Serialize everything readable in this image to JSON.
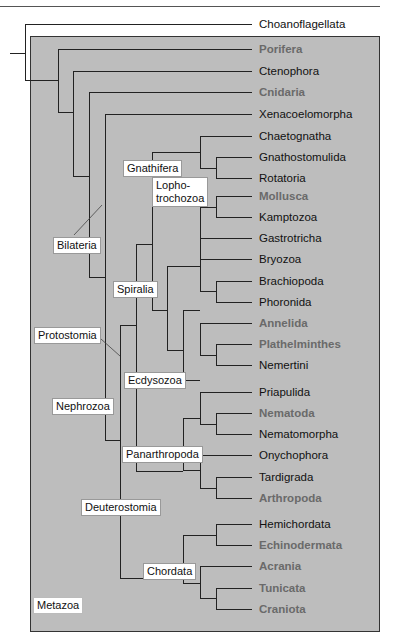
{
  "diagram": {
    "type": "phylogenetic-tree",
    "outgroup": "Choanoflagellata",
    "group_box_label": "Metazoa",
    "colors": {
      "box_fill": "#bdbdbd",
      "line": "#222222",
      "label_black": "#111111",
      "label_grey": "#6a6a6a",
      "clade_label_bg": "#ffffff"
    },
    "leaves": [
      {
        "name": "Choanoflagellata",
        "style": "black"
      },
      {
        "name": "Porifera",
        "style": "grey"
      },
      {
        "name": "Ctenophora",
        "style": "black"
      },
      {
        "name": "Cnidaria",
        "style": "grey"
      },
      {
        "name": "Xenacoelomorpha",
        "style": "black"
      },
      {
        "name": "Chaetognatha",
        "style": "black"
      },
      {
        "name": "Gnathostomulida",
        "style": "black"
      },
      {
        "name": "Rotatoria",
        "style": "black"
      },
      {
        "name": "Mollusca",
        "style": "grey"
      },
      {
        "name": "Kamptozoa",
        "style": "black"
      },
      {
        "name": "Gastrotricha",
        "style": "black"
      },
      {
        "name": "Bryozoa",
        "style": "black"
      },
      {
        "name": "Brachiopoda",
        "style": "black"
      },
      {
        "name": "Phoronida",
        "style": "black"
      },
      {
        "name": "Annelida",
        "style": "grey"
      },
      {
        "name": "Plathelminthes",
        "style": "grey"
      },
      {
        "name": "Nemertini",
        "style": "black"
      },
      {
        "name": "Priapulida",
        "style": "black"
      },
      {
        "name": "Nematoda",
        "style": "grey"
      },
      {
        "name": "Nematomorpha",
        "style": "black"
      },
      {
        "name": "Onychophora",
        "style": "black"
      },
      {
        "name": "Tardigrada",
        "style": "black"
      },
      {
        "name": "Arthropoda",
        "style": "grey"
      },
      {
        "name": "Hemichordata",
        "style": "black"
      },
      {
        "name": "Echinodermata",
        "style": "grey"
      },
      {
        "name": "Acrania",
        "style": "grey"
      },
      {
        "name": "Tunicata",
        "style": "grey"
      },
      {
        "name": "Craniota",
        "style": "grey"
      }
    ],
    "clades": [
      {
        "name": "Gnathifera"
      },
      {
        "name": "Lopho-"
      },
      {
        "name": "trochozoa"
      },
      {
        "name": "Bilateria"
      },
      {
        "name": "Spiralia"
      },
      {
        "name": "Protostomia"
      },
      {
        "name": "Ecdysozoa"
      },
      {
        "name": "Nephrozoa"
      },
      {
        "name": "Panarthropoda"
      },
      {
        "name": "Deuterostomia"
      },
      {
        "name": "Chordata"
      },
      {
        "name": "Metazoa"
      }
    ]
  }
}
